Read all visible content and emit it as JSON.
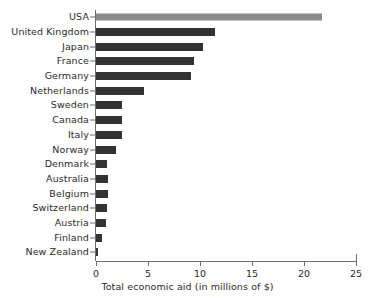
{
  "chart_data": {
    "type": "bar",
    "orientation": "horizontal",
    "title": "",
    "xlabel": "Total economic aid (in millions of $)",
    "ylabel": "",
    "xlim": [
      0,
      25
    ],
    "xticks": [
      0,
      5,
      10,
      15,
      20,
      25
    ],
    "xtick_labels": [
      "0",
      "5",
      "10",
      "15",
      "20",
      "25"
    ],
    "grid": false,
    "legend": false,
    "categories": [
      "USA",
      "United Kingdom",
      "Japan",
      "France",
      "Germany",
      "Netherlands",
      "Sweden",
      "Canada",
      "Italy",
      "Norway",
      "Denmark",
      "Australia",
      "Belgium",
      "Switzerland",
      "Austria",
      "Finland",
      "New Zealand"
    ],
    "values": [
      21.7,
      11.4,
      10.3,
      9.4,
      9.1,
      4.6,
      2.5,
      2.5,
      2.5,
      1.9,
      1.1,
      1.2,
      1.2,
      1.1,
      1.0,
      0.6,
      0.2
    ],
    "bar_colors": [
      "#8a8a8a",
      "#333333",
      "#333333",
      "#333333",
      "#333333",
      "#333333",
      "#333333",
      "#333333",
      "#333333",
      "#333333",
      "#333333",
      "#333333",
      "#333333",
      "#333333",
      "#333333",
      "#333333",
      "#333333"
    ],
    "highlight_category": "USA",
    "axis_color": "#6e6e6e",
    "text_color": "#2b2b2b",
    "background": "#ffffff"
  }
}
